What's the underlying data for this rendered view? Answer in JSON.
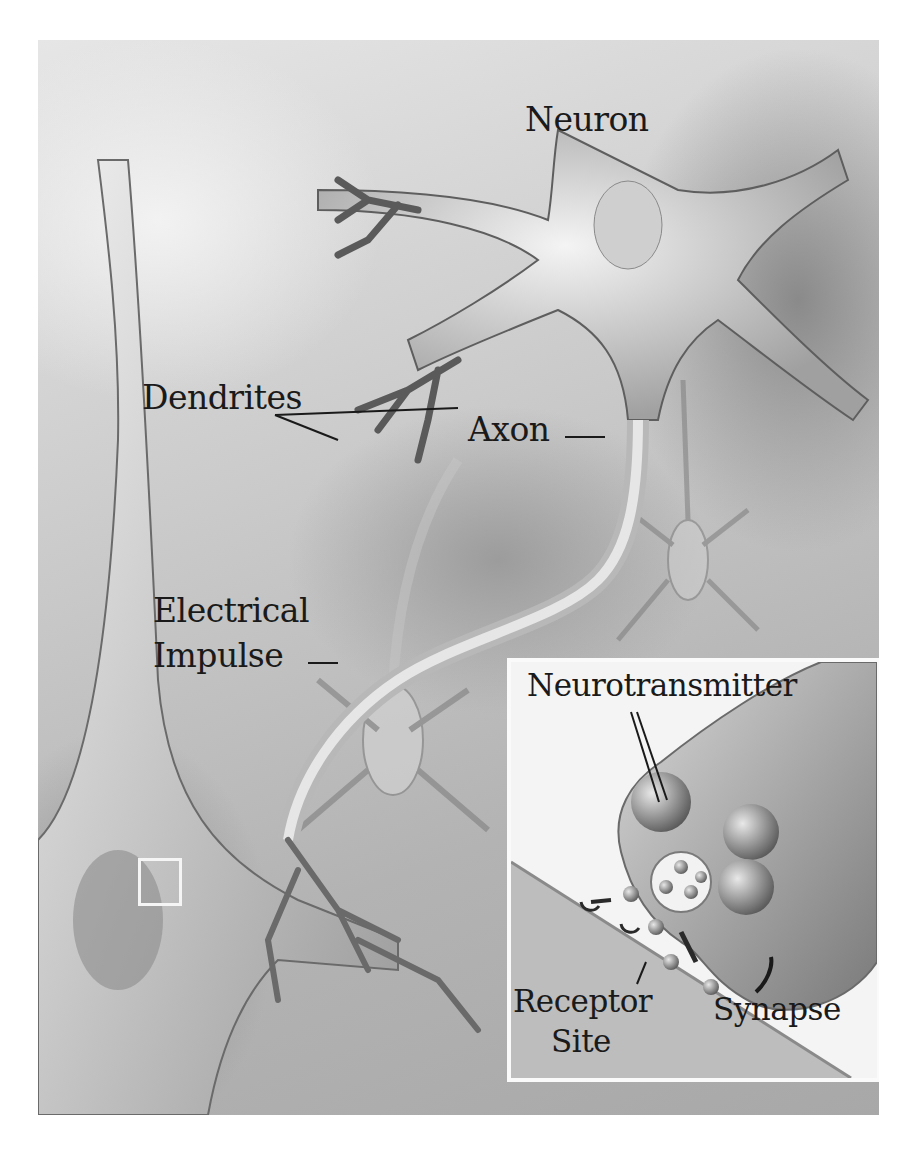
{
  "figure": {
    "style": "grayscale medical illustration",
    "colors": {
      "background": "#ffffff",
      "tissue_light": "#e6e6e6",
      "tissue_dark": "#8a8a8a",
      "label_text": "#1a1a1a",
      "inset_border": "#fafafa"
    }
  },
  "labels": {
    "neuron": "Neuron",
    "dendrites": "Dendrites",
    "axon": "Axon",
    "electrical_impulse_line1": "Electrical",
    "electrical_impulse_line2": "Impulse"
  },
  "inset": {
    "description": "Magnified view of the synaptic terminal",
    "labels": {
      "neurotransmitter": "Neurotransmitter",
      "receptor_site_line1": "Receptor",
      "receptor_site_line2": "Site",
      "synapse": "Synapse"
    }
  }
}
